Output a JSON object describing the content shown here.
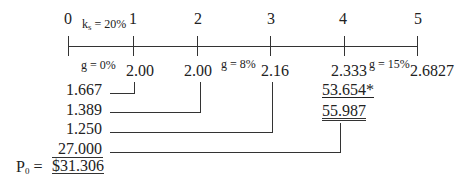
{
  "timeline": {
    "periods": [
      "0",
      "1",
      "2",
      "3",
      "4",
      "5"
    ],
    "required_return": {
      "label": "k",
      "subscript": "s",
      "value": "= 20%"
    },
    "growth_labels": [
      "g = 0%",
      "g = 8%",
      "g = 15%"
    ]
  },
  "cash_flows": {
    "t1": "2.00",
    "t2": "2.00",
    "t3": "2.16",
    "t4": "2.333",
    "t5": "2.6827"
  },
  "terminal_value": {
    "horizon_value": "53.654*",
    "total_t4": "55.987"
  },
  "present_values": [
    "1.667",
    "1.389",
    "1.250",
    "27.000"
  ],
  "result": {
    "label": "P",
    "subscript": "0",
    "equals": "=",
    "value": "$31.306"
  }
}
